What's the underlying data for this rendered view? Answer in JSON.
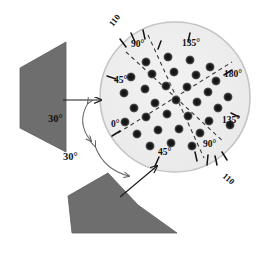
{
  "figure": {
    "colors": {
      "background": "#ffffff",
      "disc_fill": "#eeeeee",
      "disc_edge": "#bdbdbd",
      "slab_fill": "#6e6e6e",
      "slab_edge": "#5a5a5a",
      "spot_color": "#1b1b1b",
      "line_color": "#1a1a1a",
      "dashed_color": "#3a3a3a"
    },
    "disc": {
      "cx": 175,
      "cy": 97,
      "r": 75
    },
    "angle_labels": [
      {
        "id": "top-110",
        "text": "110",
        "x": 113,
        "y": 27,
        "rot": -52
      },
      {
        "id": "top-90",
        "text": "90°",
        "x": 131,
        "y": 47,
        "rot": 0
      },
      {
        "id": "top-135",
        "text": "135°",
        "x": 182,
        "y": 46,
        "rot": 0
      },
      {
        "id": "right-180",
        "text": "180°",
        "x": 224,
        "y": 77,
        "rot": 0
      },
      {
        "id": "right-135",
        "text": "135°",
        "x": 222,
        "y": 123,
        "rot": 0
      },
      {
        "id": "left-45",
        "text": "45°",
        "x": 114,
        "y": 83,
        "rot": 0
      },
      {
        "id": "left-0",
        "text": "0°",
        "x": 111,
        "y": 127,
        "rot": 0
      },
      {
        "id": "bottom-45",
        "text": "45°",
        "x": 158,
        "y": 155,
        "rot": 0
      },
      {
        "id": "bottom-90",
        "text": "90°",
        "x": 203,
        "y": 147,
        "rot": 0
      },
      {
        "id": "bottom-110",
        "text": "110",
        "x": 222,
        "y": 177,
        "rot": 40
      }
    ],
    "incidence_labels": [
      {
        "id": "angle-30-upper",
        "text": "30°",
        "x": 61,
        "y": 118
      },
      {
        "id": "angle-30-lower",
        "text": "30°",
        "x": 72,
        "y": 156
      }
    ],
    "ticks": [
      {
        "id": "tick-t1",
        "x1": 120,
        "y1": 39,
        "x2": 126,
        "y2": 47
      },
      {
        "id": "tick-t2",
        "x1": 131,
        "y1": 33,
        "x2": 135,
        "y2": 42
      },
      {
        "id": "tick-t3",
        "x1": 143,
        "y1": 30,
        "x2": 145,
        "y2": 39
      },
      {
        "id": "tick-t4",
        "x1": 158,
        "y1": 49,
        "x2": 161,
        "y2": 41
      },
      {
        "id": "tick-t5",
        "x1": 190,
        "y1": 33,
        "x2": 188,
        "y2": 42
      },
      {
        "id": "tick-t6",
        "x1": 232,
        "y1": 70,
        "x2": 224,
        "y2": 75
      },
      {
        "id": "tick-t7",
        "x1": 239,
        "y1": 117,
        "x2": 231,
        "y2": 113
      },
      {
        "id": "tick-t8",
        "x1": 107,
        "y1": 76,
        "x2": 116,
        "y2": 79
      },
      {
        "id": "tick-t9",
        "x1": 112,
        "y1": 136,
        "x2": 120,
        "y2": 131
      },
      {
        "id": "tick-t10",
        "x1": 155,
        "y1": 166,
        "x2": 159,
        "y2": 157
      },
      {
        "id": "tick-t11",
        "x1": 197,
        "y1": 161,
        "x2": 195,
        "y2": 152
      },
      {
        "id": "tick-t12",
        "x1": 207,
        "y1": 165,
        "x2": 208,
        "y2": 155
      },
      {
        "id": "tick-t13",
        "x1": 217,
        "y1": 165,
        "x2": 215,
        "y2": 156
      },
      {
        "id": "tick-t14",
        "x1": 227,
        "y1": 160,
        "x2": 222,
        "y2": 152
      }
    ],
    "dashed_lines": [
      {
        "id": "dash-0-180",
        "x1": 118,
        "y1": 133,
        "x2": 232,
        "y2": 62
      },
      {
        "id": "dash-45-135",
        "x1": 126,
        "y1": 52,
        "x2": 224,
        "y2": 142
      },
      {
        "id": "dash-90-90",
        "x1": 148,
        "y1": 35,
        "x2": 204,
        "y2": 158
      }
    ],
    "spots": {
      "radius": 5.1,
      "points": [
        [
          146,
          62
        ],
        [
          168,
          57
        ],
        [
          190,
          60
        ],
        [
          210,
          67
        ],
        [
          131,
          77
        ],
        [
          152,
          74
        ],
        [
          174,
          72
        ],
        [
          196,
          75
        ],
        [
          216,
          81
        ],
        [
          124,
          93
        ],
        [
          145,
          89
        ],
        [
          166,
          86
        ],
        [
          187,
          87
        ],
        [
          208,
          92
        ],
        [
          228,
          97
        ],
        [
          134,
          108
        ],
        [
          155,
          103
        ],
        [
          176,
          100
        ],
        [
          197,
          102
        ],
        [
          218,
          108
        ],
        [
          125,
          122
        ],
        [
          146,
          117
        ],
        [
          167,
          114
        ],
        [
          188,
          116
        ],
        [
          209,
          121
        ],
        [
          230,
          125
        ],
        [
          137,
          134
        ],
        [
          158,
          130
        ],
        [
          179,
          129
        ],
        [
          200,
          133
        ],
        [
          150,
          146
        ],
        [
          171,
          143
        ],
        [
          192,
          146
        ]
      ]
    },
    "slabs": [
      {
        "id": "slab-left",
        "points": "20,68 66,42 66,152 20,128"
      },
      {
        "id": "slab-bottom",
        "points": "68,196 108,173 138,205 177,233 72,233"
      }
    ],
    "arrows": [
      {
        "id": "incident-beam-upper",
        "x1": 63,
        "y1": 100,
        "x2": 103,
        "y2": 100
      },
      {
        "id": "incident-beam-lower",
        "x1": 122,
        "y1": 196,
        "x2": 158,
        "y2": 165
      }
    ],
    "arc_arrows": [
      {
        "id": "arc-upper",
        "path": "M 87,104 Q 75,124 90,142"
      },
      {
        "id": "arc-lower",
        "path": "M 94,148 Q 106,168 128,174"
      }
    ]
  }
}
